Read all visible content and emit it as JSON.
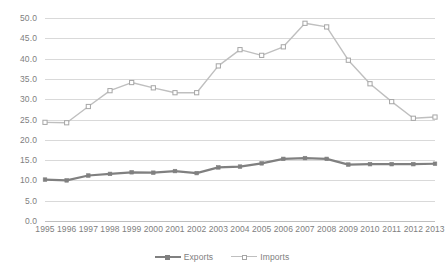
{
  "chart_data": {
    "type": "line",
    "title": "",
    "subtitle": "",
    "xlabel": "",
    "ylabel": "",
    "categories": [
      "1995",
      "1996",
      "1997",
      "1998",
      "1999",
      "2000",
      "2001",
      "2002",
      "2003",
      "2004",
      "2005",
      "2006",
      "2007",
      "2008",
      "2009",
      "2010",
      "2011",
      "2012",
      "2013"
    ],
    "ylim": [
      0,
      50
    ],
    "ytick_labels": [
      "50.0",
      "45.0",
      "40.0",
      "35.0",
      "30.0",
      "25.0",
      "20.0",
      "15.0",
      "10.0",
      "5.0",
      "0.0"
    ],
    "ytick_values": [
      50,
      45,
      40,
      35,
      30,
      25,
      20,
      15,
      10,
      5,
      0
    ],
    "grid": true,
    "legend_position": "bottom",
    "series": [
      {
        "name": "Exports",
        "color": "#808080",
        "marker": "filled-square",
        "values": [
          10.2,
          10.0,
          11.2,
          11.6,
          12.0,
          11.9,
          12.3,
          11.8,
          13.2,
          13.4,
          14.2,
          15.3,
          15.5,
          15.3,
          13.9,
          14.0,
          14.0,
          14.0,
          14.1
        ]
      },
      {
        "name": "Imports",
        "color": "#bfbfbf",
        "marker": "open-square",
        "values": [
          24.3,
          24.2,
          28.2,
          32.1,
          34.1,
          32.8,
          31.6,
          31.6,
          38.2,
          42.2,
          40.8,
          42.9,
          48.7,
          47.8,
          39.6,
          33.8,
          29.4,
          25.3,
          25.6
        ]
      }
    ]
  },
  "legend": {
    "items": [
      {
        "label": "Exports"
      },
      {
        "label": "Imports"
      }
    ]
  }
}
